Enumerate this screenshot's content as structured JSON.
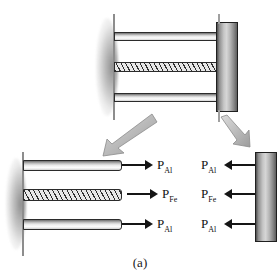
{
  "figure": {
    "caption": "(a)"
  },
  "top_assembly": {
    "name": "bonded composite bar fixed to a wall with end plate",
    "members": [
      {
        "id": "top-aluminum",
        "material": "Aluminum"
      },
      {
        "id": "middle-steel",
        "material": "Steel"
      },
      {
        "id": "bottom-aluminum",
        "material": "Aluminum"
      }
    ],
    "support": "fixed-wall",
    "end_plate": "rigid end plate"
  },
  "exploded_arrows": [
    {
      "id": "arrow-to-bars",
      "direction": "down-left"
    },
    {
      "id": "arrow-to-plate",
      "direction": "down-right"
    }
  ],
  "bars_fbd": {
    "label": "free-body diagram of the bars",
    "forces": [
      {
        "id": "bars-force-top",
        "symbol": "P",
        "subscript": "Al",
        "direction": "right"
      },
      {
        "id": "bars-force-middle",
        "symbol": "P",
        "subscript": "Fe",
        "direction": "right"
      },
      {
        "id": "bars-force-bottom",
        "symbol": "P",
        "subscript": "Al",
        "direction": "right"
      }
    ]
  },
  "plate_fbd": {
    "label": "free-body diagram of the end plate",
    "forces": [
      {
        "id": "plate-force-top",
        "symbol": "P",
        "subscript": "Al",
        "direction": "left"
      },
      {
        "id": "plate-force-middle",
        "symbol": "P",
        "subscript": "Fe",
        "direction": "left"
      },
      {
        "id": "plate-force-bottom",
        "symbol": "P",
        "subscript": "Al",
        "direction": "left"
      }
    ]
  },
  "colors": {
    "outline": "#2b2b2b",
    "metal_light": "#fbfbfb",
    "metal_dark": "#6e6e6e",
    "plate_mid": "#d6d6d6",
    "arrow": "#151515",
    "block_arrow_fill": "#b9b9b9"
  }
}
